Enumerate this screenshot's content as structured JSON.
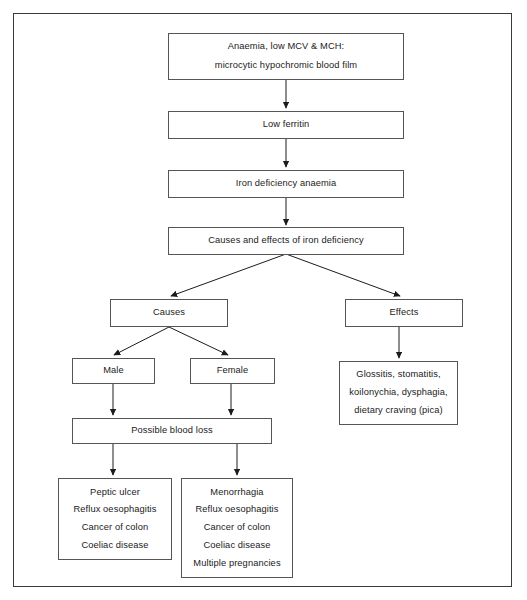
{
  "diagram": {
    "border_color": "#3a3a3a",
    "box_border_color": "#555555",
    "text_color": "#1a1a1a",
    "background": "#ffffff",
    "nodes": [
      {
        "id": "anaemia",
        "lines": [
          "Anaemia, low MCV & MCH:",
          "microcytic hypochromic blood film"
        ]
      },
      {
        "id": "low-ferritin",
        "lines": [
          "Low ferritin"
        ]
      },
      {
        "id": "iron-deficiency-anaemia",
        "lines": [
          "Iron deficiency anaemia"
        ]
      },
      {
        "id": "causes-and-effects",
        "lines": [
          "Causes and effects of iron deficiency"
        ]
      },
      {
        "id": "causes",
        "lines": [
          "Causes"
        ]
      },
      {
        "id": "effects",
        "lines": [
          "Effects"
        ]
      },
      {
        "id": "male",
        "lines": [
          "Male"
        ]
      },
      {
        "id": "female",
        "lines": [
          "Female"
        ]
      },
      {
        "id": "effects-detail",
        "lines": [
          "Glossitis, stomatitis,",
          "koilonychia, dysphagia,",
          "dietary craving (pica)"
        ]
      },
      {
        "id": "possible-blood-loss",
        "lines": [
          "Possible blood loss"
        ]
      },
      {
        "id": "male-causes",
        "lines": [
          "Peptic ulcer",
          "Reflux oesophagitis",
          "Cancer of colon",
          "Coeliac disease"
        ]
      },
      {
        "id": "female-causes",
        "lines": [
          "Menorrhagia",
          "Reflux oesophagitis",
          "Cancer of colon",
          "Coeliac disease",
          "Multiple pregnancies"
        ]
      }
    ],
    "edges": [
      {
        "from": "anaemia",
        "to": "low-ferritin",
        "kind": "vertical-arrow"
      },
      {
        "from": "low-ferritin",
        "to": "iron-deficiency-anaemia",
        "kind": "vertical-arrow"
      },
      {
        "from": "iron-deficiency-anaemia",
        "to": "causes-and-effects",
        "kind": "vertical-arrow"
      },
      {
        "from": "causes-and-effects",
        "to": "causes",
        "kind": "diagonal-arrow"
      },
      {
        "from": "causes-and-effects",
        "to": "effects",
        "kind": "diagonal-arrow"
      },
      {
        "from": "causes",
        "to": "male",
        "kind": "diagonal-arrow"
      },
      {
        "from": "causes",
        "to": "female",
        "kind": "diagonal-arrow"
      },
      {
        "from": "effects",
        "to": "effects-detail",
        "kind": "vertical-arrow"
      },
      {
        "from": "male",
        "to": "possible-blood-loss",
        "kind": "vertical-arrow"
      },
      {
        "from": "female",
        "to": "possible-blood-loss",
        "kind": "vertical-arrow"
      },
      {
        "from": "possible-blood-loss",
        "to": "male-causes",
        "kind": "vertical-arrow"
      },
      {
        "from": "possible-blood-loss",
        "to": "female-causes",
        "kind": "vertical-arrow"
      }
    ]
  }
}
